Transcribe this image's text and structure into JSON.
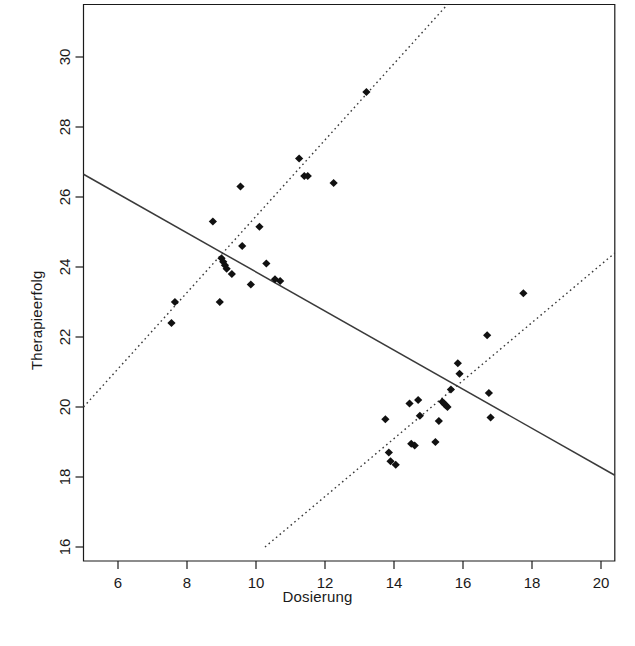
{
  "chart_data": {
    "type": "scatter",
    "title": "",
    "xlabel": "Dosierung",
    "ylabel": "Therapieerfolg",
    "xlim": [
      5.0,
      20.4
    ],
    "ylim": [
      15.6,
      31.5
    ],
    "xticks": [
      6,
      8,
      10,
      12,
      14,
      16,
      18,
      20
    ],
    "yticks": [
      16,
      18,
      20,
      22,
      24,
      26,
      28,
      30
    ],
    "grid": false,
    "legend": null,
    "marker": "filled-diamond",
    "marker_color": "#111111",
    "points": [
      {
        "x": 7.65,
        "y": 23.0
      },
      {
        "x": 7.55,
        "y": 22.4
      },
      {
        "x": 8.75,
        "y": 25.3
      },
      {
        "x": 8.95,
        "y": 23.0
      },
      {
        "x": 9.0,
        "y": 24.25
      },
      {
        "x": 9.05,
        "y": 24.15
      },
      {
        "x": 9.1,
        "y": 24.05
      },
      {
        "x": 9.15,
        "y": 23.95
      },
      {
        "x": 9.3,
        "y": 23.8
      },
      {
        "x": 9.55,
        "y": 26.3
      },
      {
        "x": 9.6,
        "y": 24.6
      },
      {
        "x": 9.85,
        "y": 23.5
      },
      {
        "x": 10.1,
        "y": 25.15
      },
      {
        "x": 10.3,
        "y": 24.1
      },
      {
        "x": 10.55,
        "y": 23.65
      },
      {
        "x": 10.7,
        "y": 23.6
      },
      {
        "x": 11.25,
        "y": 27.1
      },
      {
        "x": 11.4,
        "y": 26.6
      },
      {
        "x": 11.5,
        "y": 26.6
      },
      {
        "x": 12.25,
        "y": 26.4
      },
      {
        "x": 13.2,
        "y": 29.0
      },
      {
        "x": 13.75,
        "y": 19.65
      },
      {
        "x": 13.85,
        "y": 18.7
      },
      {
        "x": 13.9,
        "y": 18.45
      },
      {
        "x": 14.05,
        "y": 18.35
      },
      {
        "x": 14.45,
        "y": 20.1
      },
      {
        "x": 14.5,
        "y": 18.95
      },
      {
        "x": 14.6,
        "y": 18.9
      },
      {
        "x": 14.7,
        "y": 20.2
      },
      {
        "x": 14.75,
        "y": 19.75
      },
      {
        "x": 15.2,
        "y": 19.0
      },
      {
        "x": 15.3,
        "y": 19.6
      },
      {
        "x": 15.4,
        "y": 20.15
      },
      {
        "x": 15.45,
        "y": 20.1
      },
      {
        "x": 15.5,
        "y": 20.05
      },
      {
        "x": 15.55,
        "y": 20.0
      },
      {
        "x": 15.65,
        "y": 20.5
      },
      {
        "x": 15.85,
        "y": 21.25
      },
      {
        "x": 15.9,
        "y": 20.95
      },
      {
        "x": 16.7,
        "y": 22.05
      },
      {
        "x": 16.75,
        "y": 20.4
      },
      {
        "x": 16.8,
        "y": 19.7
      },
      {
        "x": 17.75,
        "y": 23.25
      }
    ],
    "lines": [
      {
        "name": "overall-regression",
        "style": "solid",
        "x1": 5.0,
        "y1": 26.65,
        "x2": 20.4,
        "y2": 18.05
      },
      {
        "name": "group-1-regression",
        "style": "dotted",
        "x1": 5.0,
        "y1": 20.0,
        "x2": 15.55,
        "y2": 31.5
      },
      {
        "name": "group-2-regression",
        "style": "dotted",
        "x1": 10.26,
        "y1": 16.0,
        "x2": 20.4,
        "y2": 24.4
      }
    ]
  },
  "axes": {
    "x_tick_labels": [
      "6",
      "8",
      "10",
      "12",
      "14",
      "16",
      "18",
      "20"
    ],
    "y_tick_labels": [
      "16",
      "18",
      "20",
      "22",
      "24",
      "26",
      "28",
      "30"
    ]
  },
  "colors": {
    "background": "#ffffff",
    "foreground": "#1a1a1a",
    "marker": "#111111",
    "line": "#3a3a3a"
  }
}
